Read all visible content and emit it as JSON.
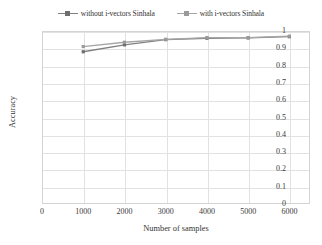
{
  "chart": {
    "type": "line",
    "title": "",
    "xlabel": "Number of samples",
    "ylabel": "Accuracy"
  },
  "legend": {
    "position": "top-center",
    "items": [
      {
        "label": "without i-vectors Sinhala",
        "color": "#808080",
        "marker": "square"
      },
      {
        "label": "with i-vectors Sinhala",
        "color": "#a6a6a6",
        "marker": "square"
      }
    ]
  },
  "axes": {
    "y": {
      "label": "Accuracy",
      "min": 0,
      "max": 1,
      "ticks": [
        "0",
        "0.1",
        "0.2",
        "0.3",
        "0.4",
        "0.5",
        "0.6",
        "0.7",
        "0.8",
        "0.9",
        "1"
      ]
    },
    "x": {
      "label": "Number of samples",
      "min": 0,
      "max": 6500,
      "ticks": [
        "0",
        "1000",
        "2000",
        "3000",
        "4000",
        "5000",
        "6000"
      ]
    }
  },
  "chart_data": {
    "type": "line",
    "title": "",
    "xlabel": "Number of samples",
    "ylabel": "Accuracy",
    "xlim": [
      0,
      6500
    ],
    "ylim": [
      0,
      1
    ],
    "grid": true,
    "legend_position": "top-center",
    "x": [
      1000,
      2000,
      3000,
      4000,
      5000,
      6000
    ],
    "series": [
      {
        "name": "without i-vectors Sinhala",
        "color": "#808080",
        "marker": "square",
        "values": [
          0.88,
          0.92,
          0.95,
          0.958,
          0.96,
          0.967
        ]
      },
      {
        "name": "with i-vectors Sinhala",
        "color": "#a6a6a6",
        "marker": "square",
        "values": [
          0.91,
          0.935,
          0.952,
          0.962,
          0.962,
          0.97
        ]
      }
    ]
  }
}
